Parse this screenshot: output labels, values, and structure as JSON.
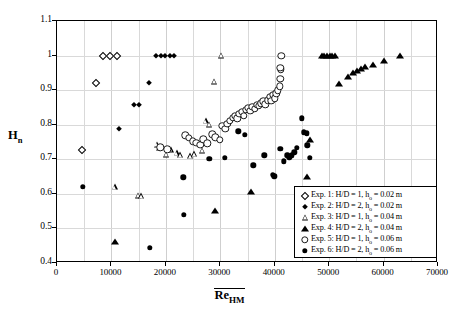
{
  "chart_data": {
    "type": "scatter",
    "title": "",
    "xlabel": "Re_HM",
    "ylabel": "H_n",
    "xlim": [
      0,
      70000
    ],
    "ylim": [
      0.4,
      1.1
    ],
    "xticks": [
      0,
      10000,
      20000,
      30000,
      40000,
      50000,
      60000,
      70000
    ],
    "xtick_labels": [
      "0",
      "10000",
      "20000",
      "30000",
      "40000",
      "50000",
      "60000",
      "70000"
    ],
    "yticks": [
      0.4,
      0.5,
      0.6,
      0.7,
      0.8,
      0.9,
      1.0,
      1.1
    ],
    "ytick_labels": [
      "0.4",
      "0.5",
      "0.6",
      "0.7",
      "0.8",
      "0.9",
      "1",
      "1.1"
    ],
    "grid": true,
    "grid_minor_x": 5000,
    "legend_position": "lower-right",
    "series": [
      {
        "name": "Exp. 1: H/D = 1, h_o = 0.02 m",
        "marker": "open-diamond",
        "points": [
          [
            4600,
            0.726
          ],
          [
            7200,
            0.922
          ],
          [
            8500,
            1.0
          ],
          [
            9800,
            1.0
          ],
          [
            11100,
            1.0
          ]
        ]
      },
      {
        "name": "Exp. 2: H/D = 2, h_o = 0.02 m",
        "marker": "filled-diamond",
        "points": [
          [
            11400,
            0.787
          ],
          [
            14100,
            0.857
          ],
          [
            15100,
            0.856
          ],
          [
            16900,
            0.922
          ],
          [
            18200,
            1.0
          ],
          [
            19100,
            1.0
          ],
          [
            19900,
            1.0
          ],
          [
            20700,
            1.0
          ],
          [
            21500,
            1.0
          ]
        ]
      },
      {
        "name": "Exp. 3: H/D = 1, h_o = 0.04 m",
        "marker": "open-triangle",
        "points": [
          [
            10600,
            0.619
          ],
          [
            14900,
            0.595
          ],
          [
            15500,
            0.593
          ],
          [
            18300,
            0.742
          ],
          [
            18700,
            0.733
          ],
          [
            20100,
            0.713
          ],
          [
            20900,
            0.727
          ],
          [
            22000,
            0.718
          ],
          [
            22600,
            0.711
          ],
          [
            24500,
            0.709
          ],
          [
            25200,
            0.715
          ],
          [
            26700,
            0.725
          ],
          [
            27300,
            0.81
          ],
          [
            27900,
            0.8
          ],
          [
            28900,
            0.925
          ],
          [
            30200,
            1.0
          ]
        ]
      },
      {
        "name": "Exp. 4: H/D = 2, h_o = 0.04 m",
        "marker": "filled-triangle",
        "points": [
          [
            10700,
            0.461
          ],
          [
            29100,
            0.551
          ],
          [
            35600,
            0.605
          ],
          [
            45900,
            0.649
          ],
          [
            46400,
            0.757
          ],
          [
            48600,
            1.0
          ],
          [
            49100,
            1.0
          ],
          [
            49600,
            1.0
          ],
          [
            50100,
            1.0
          ],
          [
            50600,
            1.0
          ],
          [
            51100,
            1.0
          ],
          [
            51900,
            0.917
          ],
          [
            53400,
            0.938
          ],
          [
            54400,
            0.951
          ],
          [
            55100,
            0.956
          ],
          [
            55800,
            0.962
          ],
          [
            56600,
            0.966
          ],
          [
            58100,
            0.974
          ],
          [
            60000,
            0.985
          ],
          [
            63000,
            1.0
          ]
        ]
      },
      {
        "name": "Exp. 5: H/D = 1, h_o = 0.06 m",
        "marker": "open-circle",
        "points": [
          [
            19000,
            0.735
          ],
          [
            20300,
            0.729
          ],
          [
            23600,
            0.769
          ],
          [
            24200,
            0.763
          ],
          [
            24900,
            0.752
          ],
          [
            25600,
            0.748
          ],
          [
            26300,
            0.742
          ],
          [
            26900,
            0.758
          ],
          [
            27600,
            0.746
          ],
          [
            28500,
            0.772
          ],
          [
            29100,
            0.764
          ],
          [
            29900,
            0.757
          ],
          [
            30400,
            0.796
          ],
          [
            30900,
            0.789
          ],
          [
            31300,
            0.803
          ],
          [
            31800,
            0.812
          ],
          [
            32300,
            0.82
          ],
          [
            32700,
            0.826
          ],
          [
            33100,
            0.818
          ],
          [
            33500,
            0.831
          ],
          [
            33900,
            0.838
          ],
          [
            34300,
            0.826
          ],
          [
            34700,
            0.843
          ],
          [
            35100,
            0.849
          ],
          [
            35500,
            0.84
          ],
          [
            35900,
            0.851
          ],
          [
            36300,
            0.846
          ],
          [
            36700,
            0.858
          ],
          [
            37100,
            0.854
          ],
          [
            37500,
            0.862
          ],
          [
            37900,
            0.868
          ],
          [
            38300,
            0.859
          ],
          [
            38700,
            0.871
          ],
          [
            39100,
            0.88
          ],
          [
            39400,
            0.869
          ],
          [
            39700,
            0.886
          ],
          [
            40000,
            0.876
          ],
          [
            40300,
            0.891
          ],
          [
            40600,
            0.9
          ],
          [
            40900,
            0.911
          ],
          [
            41000,
            0.933
          ],
          [
            41100,
            0.96
          ],
          [
            41000,
            0.965
          ],
          [
            41200,
            1.0
          ]
        ]
      },
      {
        "name": "Exp. 6: H/D = 2, h_o = 0.06 m",
        "marker": "filled-circle",
        "points": [
          [
            4700,
            0.62
          ],
          [
            17000,
            0.444
          ],
          [
            23300,
            0.54
          ],
          [
            23200,
            0.648
          ],
          [
            28000,
            0.702
          ],
          [
            30800,
            0.705
          ],
          [
            33300,
            0.781
          ],
          [
            34500,
            0.771
          ],
          [
            36100,
            0.683
          ],
          [
            38100,
            0.712
          ],
          [
            39700,
            0.655
          ],
          [
            39900,
            0.651
          ],
          [
            41000,
            0.731
          ],
          [
            41700,
            0.694
          ],
          [
            42300,
            0.712
          ],
          [
            42700,
            0.706
          ],
          [
            43100,
            0.711
          ],
          [
            43600,
            0.72
          ],
          [
            44100,
            0.734
          ],
          [
            45000,
            0.818
          ],
          [
            45400,
            0.778
          ],
          [
            45900,
            0.775
          ],
          [
            46000,
            0.74
          ],
          [
            46500,
            0.705
          ]
        ]
      }
    ]
  },
  "legend": {
    "entries": [
      {
        "marker": "open-diamond",
        "label": "Exp. 1: H/D = 1, h",
        "sub": "o",
        "tail": " = 0.02 m"
      },
      {
        "marker": "filled-diamond",
        "label": "Exp. 2: H/D = 2, h",
        "sub": "o",
        "tail": " = 0.02 m"
      },
      {
        "marker": "open-triangle",
        "label": "Exp. 3: H/D = 1, h",
        "sub": "o",
        "tail": " = 0.04 m"
      },
      {
        "marker": "filled-triangle",
        "label": "Exp. 4: H/D = 2, h",
        "sub": "o",
        "tail": " = 0.04 m"
      },
      {
        "marker": "open-circle",
        "label": "Exp. 5: H/D = 1, h",
        "sub": "o",
        "tail": " = 0.06 m"
      },
      {
        "marker": "filled-circle",
        "label": "Exp. 6: H/D = 2, h",
        "sub": "o",
        "tail": " = 0.06 m"
      }
    ]
  },
  "axis_titles": {
    "y_main": "H",
    "y_sub": "n",
    "x_main": "Re",
    "x_sub": "HM"
  }
}
